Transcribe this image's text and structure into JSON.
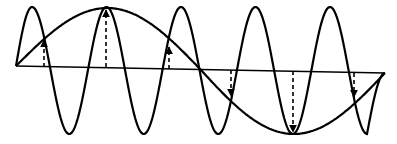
{
  "diagram": {
    "type": "wave-envelope",
    "colors": {
      "stroke": "#000000",
      "background": "#ffffff"
    },
    "baseline": {
      "x1": 16,
      "y1": 66,
      "x2": 385,
      "y2": 73
    },
    "carrier_wave": {
      "x_start": 16,
      "x_end": 385,
      "peaks_x": [
        32,
        106,
        181,
        255,
        330
      ],
      "troughs_x": [
        69,
        144,
        218,
        293,
        367
      ],
      "top_y": 7,
      "bottom_y": 134,
      "period_px": 74.5,
      "stroke_width": 2.2
    },
    "envelope": {
      "start": [
        16,
        66
      ],
      "max": [
        106,
        8
      ],
      "min": [
        293,
        134
      ],
      "end": [
        385,
        73
      ],
      "stroke_width": 2.2
    },
    "arrows": [
      {
        "x": 44,
        "from_y": 67,
        "to_y": 40,
        "direction": "up"
      },
      {
        "x": 106,
        "from_y": 67,
        "to_y": 10,
        "direction": "up"
      },
      {
        "x": 169,
        "from_y": 69,
        "to_y": 47,
        "direction": "up"
      },
      {
        "x": 231,
        "from_y": 70,
        "to_y": 96,
        "direction": "down"
      },
      {
        "x": 293,
        "from_y": 71,
        "to_y": 132,
        "direction": "down"
      },
      {
        "x": 354,
        "from_y": 73,
        "to_y": 97,
        "direction": "down"
      }
    ]
  }
}
